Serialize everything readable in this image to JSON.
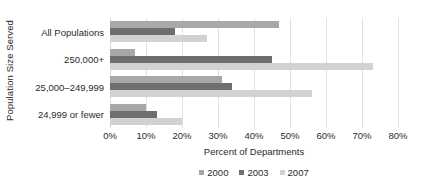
{
  "chart_data": {
    "type": "bar",
    "orientation": "horizontal",
    "title": "",
    "xlabel": "Percent of Departments",
    "ylabel": "Population Size Served",
    "xlim": [
      0,
      80
    ],
    "xticks": [
      "0%",
      "10%",
      "20%",
      "30%",
      "40%",
      "50%",
      "60%",
      "70%",
      "80%"
    ],
    "xtick_values": [
      0,
      10,
      20,
      30,
      40,
      50,
      60,
      70,
      80
    ],
    "grid": true,
    "legend_position": "bottom",
    "categories": [
      "All Populations",
      "250,000+",
      "25,000–249,999",
      "24,999 or fewer"
    ],
    "series": [
      {
        "name": "2000",
        "color": "#a8a8a8",
        "values": [
          47,
          7,
          31,
          10
        ]
      },
      {
        "name": "2003",
        "color": "#6e6e6e",
        "values": [
          18,
          45,
          34,
          13
        ]
      },
      {
        "name": "2007",
        "color": "#d2d2d2",
        "values": [
          27,
          73,
          56,
          20
        ]
      }
    ]
  },
  "style": {
    "gridline_color": "#e2e2e2",
    "text_color": "#2b2b2b",
    "background": "#ffffff"
  }
}
